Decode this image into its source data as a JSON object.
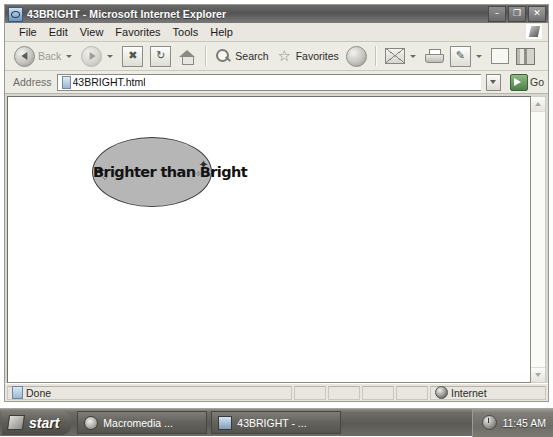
{
  "window": {
    "title": "43BRIGHT - Microsoft Internet Explorer",
    "icon": "ie-document-icon",
    "controls": {
      "minimize": "–",
      "restore": "❐",
      "close": "✕"
    }
  },
  "menubar": {
    "items": [
      {
        "label": "File"
      },
      {
        "label": "Edit"
      },
      {
        "label": "View"
      },
      {
        "label": "Favorites"
      },
      {
        "label": "Tools"
      },
      {
        "label": "Help"
      }
    ]
  },
  "toolbar": {
    "back": "Back",
    "forward": "",
    "stop": "",
    "refresh": "",
    "home": "",
    "search": "Search",
    "favorites": "Favorites",
    "media": "",
    "mail": "",
    "print": "",
    "edit": "",
    "discuss": "",
    "research": ""
  },
  "address": {
    "label": "Address",
    "value": "43BRIGHT.html",
    "placeholder": "43BRIGHT.html",
    "go_label": "Go"
  },
  "document": {
    "bubble_text": "Brighter than Bright",
    "sparkles": [
      "✦",
      "✧",
      "✦",
      "✧"
    ],
    "bubble_fill": "#b6b6b6",
    "bubble_stroke": "#3d3d3d"
  },
  "statusbar": {
    "status": "Done",
    "zone": "Internet"
  },
  "taskbar": {
    "start_label": "start",
    "tasks": [
      {
        "label": "Macromedia ...",
        "icon": "flash-icon"
      },
      {
        "label": "43BRIGHT - ...",
        "icon": "ie-icon"
      }
    ],
    "clock": "11:45 AM"
  }
}
